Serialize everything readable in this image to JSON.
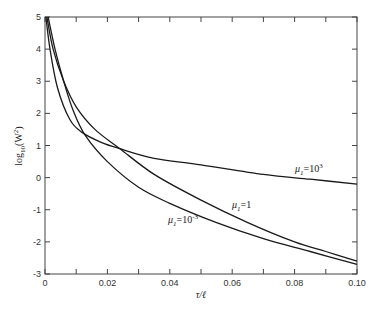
{
  "chart_data": {
    "type": "line",
    "title": "",
    "xlabel": "τ/ℓ",
    "ylabel": "log₁₀(W²)",
    "xlim": [
      0,
      0.1
    ],
    "ylim": [
      -3,
      5
    ],
    "grid": false,
    "x_ticks": [
      0,
      0.01,
      0.02,
      0.03,
      0.04,
      0.05,
      0.06,
      0.07,
      0.08,
      0.09,
      0.1
    ],
    "x_tick_labels": [
      "0",
      "",
      "0.02",
      "",
      "0.04",
      "",
      "0.06",
      "",
      "0.08",
      "",
      "0.10"
    ],
    "y_ticks": [
      -3,
      -2,
      -1,
      0,
      1,
      2,
      3,
      4,
      5
    ],
    "y_tick_labels": [
      "-3",
      "-2",
      "-1",
      "0",
      "1",
      "2",
      "3",
      "4",
      "5"
    ],
    "series": [
      {
        "name": "μ₁=10³",
        "label_text": "μ₁=10³",
        "x": [
          0.0003,
          0.0016,
          0.004,
          0.008,
          0.012,
          0.018,
          0.024,
          0.035,
          0.05,
          0.07,
          0.085,
          0.1
        ],
        "y": [
          5.0,
          4.0,
          2.8,
          1.8,
          1.4,
          1.1,
          0.9,
          0.6,
          0.4,
          0.1,
          -0.05,
          -0.2
        ]
      },
      {
        "name": "μ₁=1",
        "label_text": "μ₁=1",
        "x": [
          0.0006,
          0.0026,
          0.006,
          0.01,
          0.016,
          0.024,
          0.035,
          0.05,
          0.065,
          0.08,
          0.09,
          0.1
        ],
        "y": [
          5.0,
          4.0,
          3.0,
          2.2,
          1.5,
          0.9,
          0.1,
          -0.7,
          -1.4,
          -2.0,
          -2.3,
          -2.6
        ]
      },
      {
        "name": "μ₁=10⁻³",
        "label_text": "μ₁=10⁻³",
        "x": [
          0.001,
          0.0032,
          0.006,
          0.009,
          0.013,
          0.02,
          0.03,
          0.04,
          0.055,
          0.07,
          0.085,
          0.1
        ],
        "y": [
          5.0,
          4.0,
          3.0,
          2.1,
          1.3,
          0.5,
          -0.3,
          -0.8,
          -1.4,
          -1.9,
          -2.3,
          -2.7
        ]
      }
    ],
    "annotations": [
      {
        "text": "μ₁=10³",
        "x": 0.079,
        "y": 0.2
      },
      {
        "text": "μ₁=1",
        "x": 0.06,
        "y": -0.9
      },
      {
        "text": "μ₁=10⁻³",
        "x": 0.04,
        "y": -1.4
      }
    ]
  },
  "labels": {
    "xlabel": "τ/ℓ",
    "ylabel_main": "log",
    "ylabel_sub": "10",
    "ylabel_rest": "(W",
    "ylabel_sup": "2",
    "ylabel_close": ")",
    "ann1_mu": "μ",
    "ann1_sub": "1",
    "ann1_eq": "=10",
    "ann1_sup": "3",
    "ann2_mu": "μ",
    "ann2_sub": "1",
    "ann2_eq": "=1",
    "ann3_mu": "μ",
    "ann3_sub": "1",
    "ann3_eq": "=10",
    "ann3_sup": "-3"
  }
}
